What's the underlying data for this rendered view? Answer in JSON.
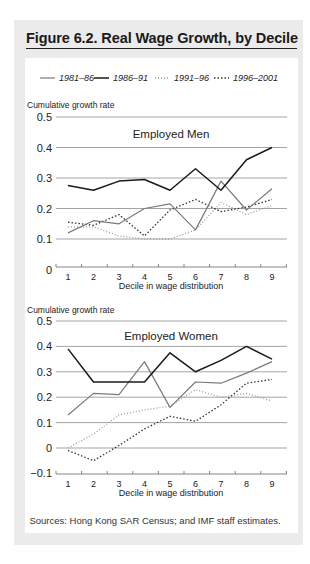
{
  "figure": {
    "title": "Figure 6.2. Real Wage Growth, by Decile",
    "source": "Sources: Hong Kong SAR Census; and IMF staff estimates."
  },
  "legend": [
    {
      "label": "1981–86",
      "style": "solid",
      "color": "#7a7a7a"
    },
    {
      "label": "1986–91",
      "style": "solid",
      "color": "#1a1a1a"
    },
    {
      "label": "1991–96",
      "style": "dotted",
      "color": "#9a9a9a"
    },
    {
      "label": "1996–2001",
      "style": "dotted",
      "color": "#333333"
    }
  ],
  "chart_data": [
    {
      "type": "line",
      "title": "Employed Men",
      "xlabel": "Decile in wage distribution",
      "ylabel": "Cumulative growth rate",
      "x": [
        1,
        2,
        3,
        4,
        5,
        6,
        7,
        8,
        9
      ],
      "ylim": [
        0,
        0.5
      ],
      "yticks": [
        "0",
        "0.1",
        "0.2",
        "0.3",
        "0.4",
        "0.5"
      ],
      "grid": true,
      "legend_position": "top",
      "series": [
        {
          "name": "1981–86",
          "values": [
            0.12,
            0.16,
            0.15,
            0.2,
            0.215,
            0.13,
            0.29,
            0.195,
            0.265
          ]
        },
        {
          "name": "1986–91",
          "values": [
            0.275,
            0.26,
            0.29,
            0.295,
            0.26,
            0.33,
            0.26,
            0.36,
            0.4
          ]
        },
        {
          "name": "1991–96",
          "values": [
            0.14,
            0.14,
            0.11,
            0.1,
            0.1,
            0.13,
            0.22,
            0.18,
            0.21
          ]
        },
        {
          "name": "1996–2001",
          "values": [
            0.155,
            0.145,
            0.18,
            0.11,
            0.195,
            0.23,
            0.19,
            0.205,
            0.23
          ]
        }
      ]
    },
    {
      "type": "line",
      "title": "Employed Women",
      "xlabel": "Decile in wage distribution",
      "ylabel": "Cumulative growth rate",
      "x": [
        1,
        2,
        3,
        4,
        5,
        6,
        7,
        8,
        9
      ],
      "ylim": [
        -0.1,
        0.5
      ],
      "yticks": [
        "−0.1",
        "0",
        "0.1",
        "0.2",
        "0.3",
        "0.4",
        "0.5"
      ],
      "grid": true,
      "legend_position": "top",
      "series": [
        {
          "name": "1981–86",
          "values": [
            0.13,
            0.215,
            0.21,
            0.34,
            0.16,
            0.26,
            0.255,
            0.295,
            0.34
          ]
        },
        {
          "name": "1986–91",
          "values": [
            0.39,
            0.26,
            0.26,
            0.26,
            0.375,
            0.3,
            0.345,
            0.4,
            0.35
          ]
        },
        {
          "name": "1991–96",
          "values": [
            0.0,
            0.055,
            0.13,
            0.15,
            0.165,
            0.23,
            0.2,
            0.215,
            0.185
          ]
        },
        {
          "name": "1996–2001",
          "values": [
            -0.01,
            -0.05,
            0.01,
            0.075,
            0.125,
            0.105,
            0.17,
            0.255,
            0.27
          ]
        }
      ]
    }
  ]
}
